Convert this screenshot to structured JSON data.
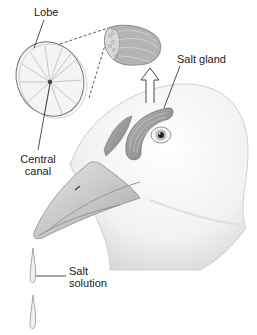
{
  "diagram": {
    "labels": {
      "lobe": "Lobe",
      "central_canal_line1": "Central",
      "central_canal_line2": "canal",
      "salt_gland": "Salt gland",
      "salt_solution_line1": "Salt",
      "salt_solution_line2": "solution"
    },
    "colors": {
      "gland": "#9a9a9a",
      "outline": "#555555",
      "head_shade": "#e6e6e6",
      "beak": "#c9c9c9"
    }
  }
}
